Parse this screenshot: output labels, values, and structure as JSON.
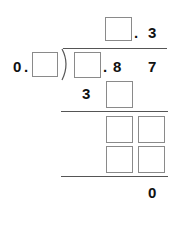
{
  "puzzle": {
    "type": "long-division",
    "quotient": {
      "blank_before_decimal": true,
      "decimal_point": ".",
      "digit_after_decimal": "3"
    },
    "divisor": {
      "integer": "0",
      "decimal_point": ".",
      "blank_after_decimal": true
    },
    "dividend": {
      "blank_before_decimal": true,
      "decimal_point": ".",
      "digits_after_decimal": [
        "8",
        "7"
      ]
    },
    "step1_subtract": {
      "digits": [
        "3"
      ],
      "blanks": 1
    },
    "step2_remainder_row": {
      "blanks": 2
    },
    "step2_subtract_row": {
      "blanks": 2
    },
    "final_remainder": "0"
  },
  "labels": {
    "quotient_dot": ".",
    "quotient_digit": "3",
    "divisor_zero": "0",
    "divisor_dot": ".",
    "dividend_dot": ".",
    "dividend_digit_1": "8",
    "dividend_digit_2": "7",
    "step1_digit": "3",
    "remainder": "0"
  },
  "colors": {
    "box_border": "#8a8a8a",
    "line": "#555555",
    "text": "#111111"
  }
}
